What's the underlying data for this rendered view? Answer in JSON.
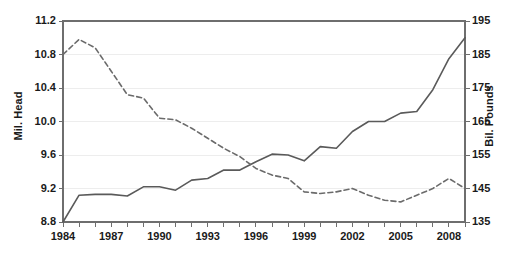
{
  "chart_data": {
    "type": "line",
    "title": "",
    "xlabel": "",
    "ylabel": "Mil. Head",
    "y2label": "Bil. Pounds",
    "grid": true,
    "legend": "none",
    "xlim": [
      1984,
      2009
    ],
    "ylim": [
      8.8,
      11.2
    ],
    "y2lim": [
      135,
      195
    ],
    "ytick_labels": [
      "8.8",
      "9.2",
      "9.6",
      "10.0",
      "10.4",
      "10.8",
      "11.2"
    ],
    "ytick_values": [
      8.8,
      9.2,
      9.6,
      10.0,
      10.4,
      10.8,
      11.2
    ],
    "y2tick_labels": [
      "135",
      "145",
      "155",
      "165",
      "175",
      "185",
      "195"
    ],
    "y2tick_values": [
      135,
      145,
      155,
      165,
      175,
      185,
      195
    ],
    "xtick_labels": [
      "1984",
      "1987",
      "1990",
      "1993",
      "1996",
      "1999",
      "2002",
      "2005",
      "2008"
    ],
    "xtick_values": [
      1984,
      1987,
      1990,
      1993,
      1996,
      1999,
      2002,
      2005,
      2008
    ],
    "x": [
      1984,
      1985,
      1986,
      1987,
      1988,
      1989,
      1990,
      1991,
      1992,
      1993,
      1994,
      1995,
      1996,
      1997,
      1998,
      1999,
      2000,
      2001,
      2002,
      2003,
      2004,
      2005,
      2006,
      2007,
      2008,
      2009
    ],
    "series": [
      {
        "name": "Mil. Head",
        "axis": "left",
        "style": "solid",
        "color": "#5a5a5a",
        "values": [
          8.8,
          9.12,
          9.13,
          9.13,
          9.11,
          9.22,
          9.22,
          9.18,
          9.3,
          9.32,
          9.42,
          9.42,
          9.52,
          9.61,
          9.6,
          9.53,
          9.7,
          9.68,
          9.88,
          10.0,
          10.0,
          10.1,
          10.12,
          10.38,
          10.75,
          11.0
        ]
      },
      {
        "name": "Bil. Pounds",
        "axis": "right",
        "style": "dashed",
        "color": "#6b6b6b",
        "values": [
          185.0,
          189.5,
          187.0,
          180.0,
          173.0,
          172.0,
          166.0,
          165.5,
          163.0,
          160.0,
          157.0,
          154.5,
          151.0,
          149.0,
          148.0,
          144.0,
          143.5,
          144.0,
          145.0,
          143.0,
          141.5,
          141.0,
          143.0,
          145.0,
          148.0,
          145.0
        ]
      }
    ]
  }
}
